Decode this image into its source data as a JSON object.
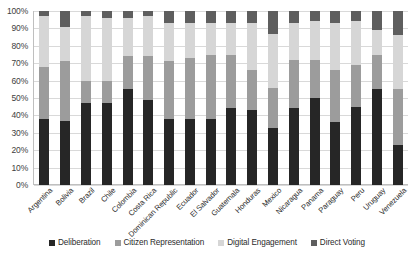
{
  "chart_data": {
    "type": "bar",
    "subtype": "stacked-bar-100-percent",
    "title": "",
    "xlabel": "",
    "ylabel": "",
    "ylim": [
      0,
      100
    ],
    "ytick_labels": [
      "100%",
      "90%",
      "80%",
      "70%",
      "60%",
      "50%",
      "40%",
      "30%",
      "20%",
      "10%",
      "0%"
    ],
    "ytick_values": [
      100,
      90,
      80,
      70,
      60,
      50,
      40,
      30,
      20,
      10,
      0
    ],
    "grid": true,
    "legend_position": "bottom",
    "categories": [
      "Argentina",
      "Bolivia",
      "Brazil",
      "Chile",
      "Colombia",
      "Costa Rica",
      "Dominican Republic",
      "Ecuador",
      "El Salvador",
      "Guatemala",
      "Honduras",
      "Mexico",
      "Nicaragua",
      "Panama",
      "Paraguay",
      "Peru",
      "Uruguay",
      "Venezuela"
    ],
    "series": [
      {
        "name": "Deliberation",
        "color": "#262626",
        "values": [
          38,
          37,
          47,
          47,
          55,
          49,
          38,
          38,
          38,
          44,
          43,
          33,
          44,
          50,
          36,
          45,
          55,
          23
        ]
      },
      {
        "name": "Citizen Representation",
        "color": "#9c9c9c",
        "values": [
          30,
          34,
          13,
          13,
          19,
          25,
          33,
          35,
          37,
          31,
          23,
          23,
          28,
          22,
          30,
          24,
          20,
          32
        ]
      },
      {
        "name": "Digital Engagement",
        "color": "#d6d6d6",
        "values": [
          29,
          20,
          37,
          36,
          22,
          23,
          22,
          20,
          18,
          18,
          27,
          31,
          21,
          22,
          27,
          25,
          14,
          31
        ]
      },
      {
        "name": "Direct Voting",
        "color": "#5e5e5e",
        "values": [
          3,
          9,
          3,
          4,
          4,
          3,
          7,
          7,
          7,
          7,
          7,
          13,
          7,
          6,
          7,
          6,
          11,
          14
        ]
      }
    ]
  },
  "legend": {
    "items": [
      {
        "label": "Deliberation",
        "color": "#262626"
      },
      {
        "label": "Citizen Representation",
        "color": "#9c9c9c"
      },
      {
        "label": "Digital Engagement",
        "color": "#d6d6d6"
      },
      {
        "label": "Direct Voting",
        "color": "#5e5e5e"
      }
    ]
  },
  "colors": {
    "background": "#ffffff",
    "gridline": "#d9d9d9",
    "axis": "#bfbfbf",
    "text": "#2b2b2b"
  }
}
